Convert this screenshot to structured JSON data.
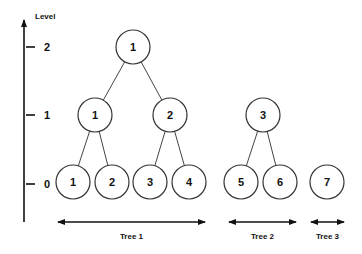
{
  "axis": {
    "title": "Level",
    "ticks": [
      {
        "label": "2",
        "y": 47
      },
      {
        "label": "1",
        "y": 115
      },
      {
        "label": "0",
        "y": 184
      }
    ]
  },
  "nodes": [
    {
      "id": "r1",
      "label": "1",
      "level": 2,
      "x": 133,
      "y": 47
    },
    {
      "id": "a1",
      "label": "1",
      "level": 1,
      "x": 95,
      "y": 115
    },
    {
      "id": "a2",
      "label": "2",
      "level": 1,
      "x": 170,
      "y": 115
    },
    {
      "id": "a3",
      "label": "3",
      "level": 1,
      "x": 263,
      "y": 115
    },
    {
      "id": "l1",
      "label": "1",
      "level": 0,
      "x": 73,
      "y": 182
    },
    {
      "id": "l2",
      "label": "2",
      "level": 0,
      "x": 112,
      "y": 182
    },
    {
      "id": "l3",
      "label": "3",
      "level": 0,
      "x": 150,
      "y": 182
    },
    {
      "id": "l4",
      "label": "4",
      "level": 0,
      "x": 189,
      "y": 182
    },
    {
      "id": "l5",
      "label": "5",
      "level": 0,
      "x": 241,
      "y": 182
    },
    {
      "id": "l6",
      "label": "6",
      "level": 0,
      "x": 280,
      "y": 182
    },
    {
      "id": "l7",
      "label": "7",
      "level": 0,
      "x": 327,
      "y": 182
    }
  ],
  "edges": [
    [
      "r1",
      "a1"
    ],
    [
      "r1",
      "a2"
    ],
    [
      "a1",
      "l1"
    ],
    [
      "a1",
      "l2"
    ],
    [
      "a2",
      "l3"
    ],
    [
      "a2",
      "l4"
    ],
    [
      "a3",
      "l5"
    ],
    [
      "a3",
      "l6"
    ]
  ],
  "trees": [
    {
      "label": "Tree 1",
      "x1": 58,
      "x2": 205
    },
    {
      "label": "Tree 2",
      "x1": 229,
      "x2": 296
    },
    {
      "label": "Tree 3",
      "x1": 311,
      "x2": 344
    }
  ]
}
